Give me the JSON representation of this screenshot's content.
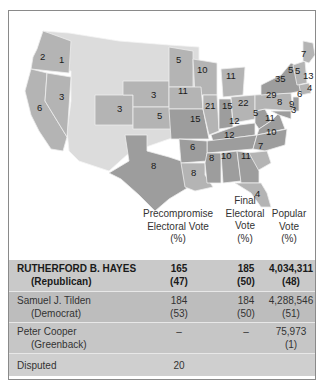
{
  "map": {
    "legend_colors": {
      "hayes_republican": "#b4b4b4",
      "tilden_democrat": "#9d9d9d",
      "territory": "#dcdcdc",
      "disputed": "#c4c4c4"
    },
    "state_votes": [
      {
        "state": "Oregon",
        "value": "2"
      },
      {
        "state": "Oregon-east",
        "value": "1"
      },
      {
        "state": "California",
        "value": "6"
      },
      {
        "state": "Nevada",
        "value": "3"
      },
      {
        "state": "Colorado",
        "value": "3"
      },
      {
        "state": "Nebraska",
        "value": "3"
      },
      {
        "state": "Kansas",
        "value": "5"
      },
      {
        "state": "Texas",
        "value": "8"
      },
      {
        "state": "Minnesota",
        "value": "5"
      },
      {
        "state": "Wisconsin",
        "value": "10"
      },
      {
        "state": "Michigan",
        "value": "11"
      },
      {
        "state": "Iowa",
        "value": "11"
      },
      {
        "state": "Illinois",
        "value": "21"
      },
      {
        "state": "Indiana",
        "value": "15"
      },
      {
        "state": "Ohio",
        "value": "22"
      },
      {
        "state": "Missouri",
        "value": "15"
      },
      {
        "state": "Kentucky",
        "value": "12"
      },
      {
        "state": "West Virginia",
        "value": "5"
      },
      {
        "state": "Virginia",
        "value": "11"
      },
      {
        "state": "Tennessee",
        "value": "12"
      },
      {
        "state": "North Carolina",
        "value": "10"
      },
      {
        "state": "South Carolina",
        "value": "7"
      },
      {
        "state": "Arkansas",
        "value": "6"
      },
      {
        "state": "Mississippi",
        "value": "8"
      },
      {
        "state": "Alabama",
        "value": "10"
      },
      {
        "state": "Georgia",
        "value": "11"
      },
      {
        "state": "Louisiana",
        "value": "8"
      },
      {
        "state": "Florida",
        "value": "4"
      },
      {
        "state": "Pennsylvania",
        "value": "29"
      },
      {
        "state": "New York",
        "value": "35"
      },
      {
        "state": "Vermont",
        "value": "5"
      },
      {
        "state": "New Hampshire",
        "value": "5"
      },
      {
        "state": "Maine",
        "value": "7"
      },
      {
        "state": "Massachusetts",
        "value": "13"
      },
      {
        "state": "Rhode Island",
        "value": "4"
      },
      {
        "state": "Connecticut",
        "value": "6"
      },
      {
        "state": "New Jersey",
        "value": "9"
      },
      {
        "state": "Maryland",
        "value": "8"
      },
      {
        "state": "Delaware",
        "value": "3"
      }
    ]
  },
  "table": {
    "headers": {
      "precompromise": [
        "Precompromise",
        "Electoral Vote",
        "(%)"
      ],
      "final": [
        "Final",
        "Electoral",
        "Vote",
        "(%)"
      ],
      "popular": [
        "Popular",
        "Vote",
        "(%)"
      ]
    },
    "rows": [
      {
        "name": "RUTHERFORD B. HAYES",
        "party": "(Republican)",
        "pre": "165",
        "pre_pct": "(47)",
        "fin": "185",
        "fin_pct": "(50)",
        "pop": "4,034,311",
        "pop_pct": "(48)"
      },
      {
        "name": "Samuel J. Tilden",
        "party": "(Democrat)",
        "pre": "184",
        "pre_pct": "(53)",
        "fin": "184",
        "fin_pct": "(50)",
        "pop": "4,288,546",
        "pop_pct": "(51)"
      },
      {
        "name": "Peter Cooper",
        "party": "(Greenback)",
        "pre": "–",
        "pre_pct": "",
        "fin": "–",
        "fin_pct": "",
        "pop": "75,973",
        "pop_pct": "(1)"
      },
      {
        "name": "Disputed",
        "party": "",
        "pre": "20",
        "pre_pct": "",
        "fin": "",
        "fin_pct": "",
        "pop": "",
        "pop_pct": ""
      }
    ]
  }
}
